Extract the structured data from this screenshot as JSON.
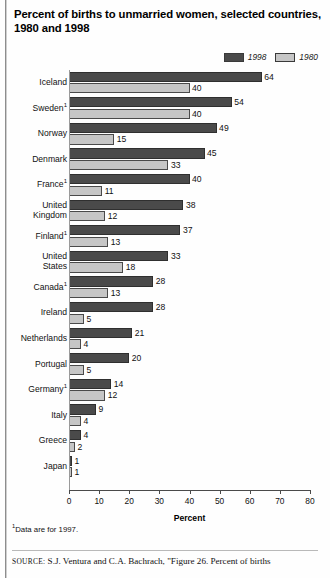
{
  "title": {
    "line1": "Percent of births to unmarried women, selected countries,",
    "line2": "1980 and 1998"
  },
  "legend": [
    {
      "label": "1998",
      "color": "#4a4a4a"
    },
    {
      "label": "1980",
      "color": "#c6c6c6"
    }
  ],
  "axis": {
    "title": "Percent",
    "ticks": [
      "0",
      "10",
      "20",
      "30",
      "40",
      "50",
      "60",
      "70",
      "80"
    ]
  },
  "footnote": "Data are for 1997.",
  "footnote_marker": "1",
  "source": {
    "label": "SOURCE:",
    "text": " S.J. Ventura and C.A. Bachrach, \"Figure 26. Percent of births"
  },
  "chart_data": {
    "type": "bar",
    "title": "Percent of births to unmarried women, selected countries, 1980 and 1998",
    "xlabel": "Percent",
    "ylabel": "",
    "xlim": [
      0,
      80
    ],
    "grid": false,
    "legend_position": "top-right",
    "orientation": "horizontal",
    "categories": [
      "Iceland",
      "Sweden",
      "Norway",
      "Denmark",
      "France",
      "United Kingdom",
      "Finland",
      "United States",
      "Canada",
      "Ireland",
      "Netherlands",
      "Portugal",
      "Germany",
      "Italy",
      "Greece",
      "Japan"
    ],
    "category_footnotes": [
      "",
      "1",
      "",
      "",
      "1",
      "",
      "1",
      "",
      "1",
      "",
      "",
      "",
      "1",
      "",
      "",
      ""
    ],
    "series": [
      {
        "name": "1998",
        "color": "#4a4a4a",
        "values": [
          64,
          54,
          49,
          45,
          40,
          38,
          37,
          33,
          28,
          28,
          21,
          20,
          14,
          9,
          4,
          1
        ]
      },
      {
        "name": "1980",
        "color": "#c6c6c6",
        "values": [
          40,
          40,
          15,
          33,
          11,
          12,
          13,
          18,
          13,
          5,
          4,
          5,
          12,
          4,
          2,
          1
        ]
      }
    ]
  }
}
